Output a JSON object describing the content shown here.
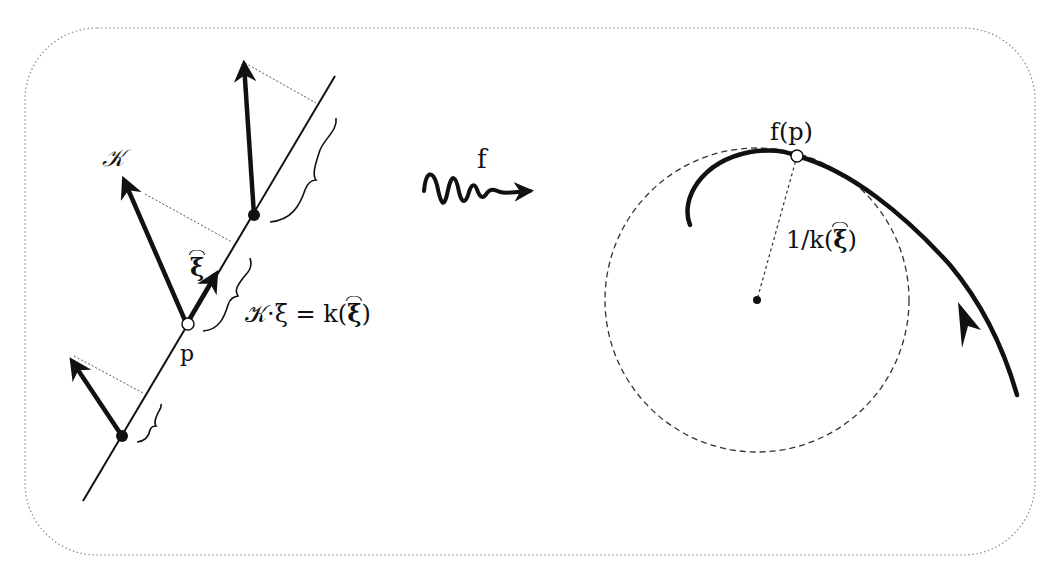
{
  "diagram": {
    "left_panel": {
      "curvature_vector_label": "𝒦",
      "unit_direction_label": "ξ",
      "point_label": "p",
      "equation": {
        "lhs": "𝒦·ξ",
        "equals": "=",
        "rhs_fn": "k(",
        "rhs_arg": "ξ",
        "rhs_close": ")"
      }
    },
    "map_label": "f",
    "right_panel": {
      "image_point_label": "f(p)",
      "radius_label_prefix": "1/k(",
      "radius_label_arg": "ξ",
      "radius_label_suffix": ")"
    },
    "colors": {
      "ink": "#111111",
      "border": "#8a8a8a",
      "background": "#ffffff"
    }
  }
}
